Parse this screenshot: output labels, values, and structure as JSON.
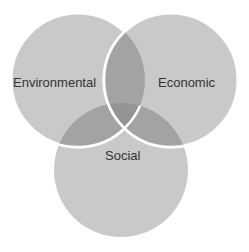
{
  "diagram": {
    "type": "venn",
    "circles": [
      {
        "id": "environmental",
        "label": "Environmental",
        "cx": 78,
        "cy": 80,
        "r": 67
      },
      {
        "id": "economic",
        "label": "Economic",
        "cx": 171,
        "cy": 80,
        "r": 67
      },
      {
        "id": "social",
        "label": "Social",
        "cx": 121,
        "cy": 170,
        "r": 67
      }
    ],
    "colors": {
      "fill": "#c8c8c8",
      "overlap": "#a0a0a0",
      "center": "#8e8e8e",
      "stroke": "#ffffff",
      "text": "#333333"
    }
  }
}
